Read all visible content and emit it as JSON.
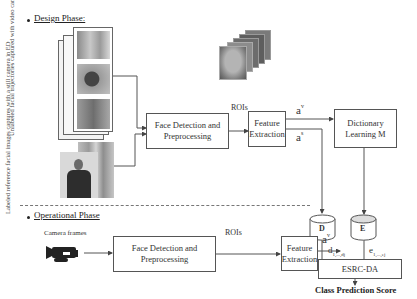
{
  "design_phase": {
    "title": "Design Phase:",
    "video_label": "Unlabeled facial trajectories captured with video cameras in multiple OD",
    "still_label": "Labeled reference facial images captures with a still camera in ED",
    "face_detection": "Face Detection and Preprocessing",
    "rois": "ROIs",
    "feature_extraction": "Feature Extraction",
    "a_v": "a",
    "a_v_sup": "v",
    "a_s": "a",
    "a_s_sup": "s",
    "dictionary": "Dictionary Learning M",
    "db_d": "D",
    "db_e": "E"
  },
  "operational_phase": {
    "title": "Operational Phase",
    "camera_label": "Camera frames",
    "face_detection": "Face Detection and Preprocessing",
    "rois": "ROIs",
    "feature_extraction": "Feature Extraction",
    "a_v": "a",
    "a_v_sup": "v",
    "d_label": "d",
    "d_range": "1,...,d",
    "d_sub_j": "j",
    "e_label": "e",
    "e_range": "1,...,e",
    "e_sub_j": "j",
    "esrc": "ESRC-DA",
    "output": "Class Prediction Score"
  },
  "icons": {
    "camera": "video-camera-icon",
    "database": "cylinder-database-icon",
    "face_stack": "face-images-stack"
  }
}
